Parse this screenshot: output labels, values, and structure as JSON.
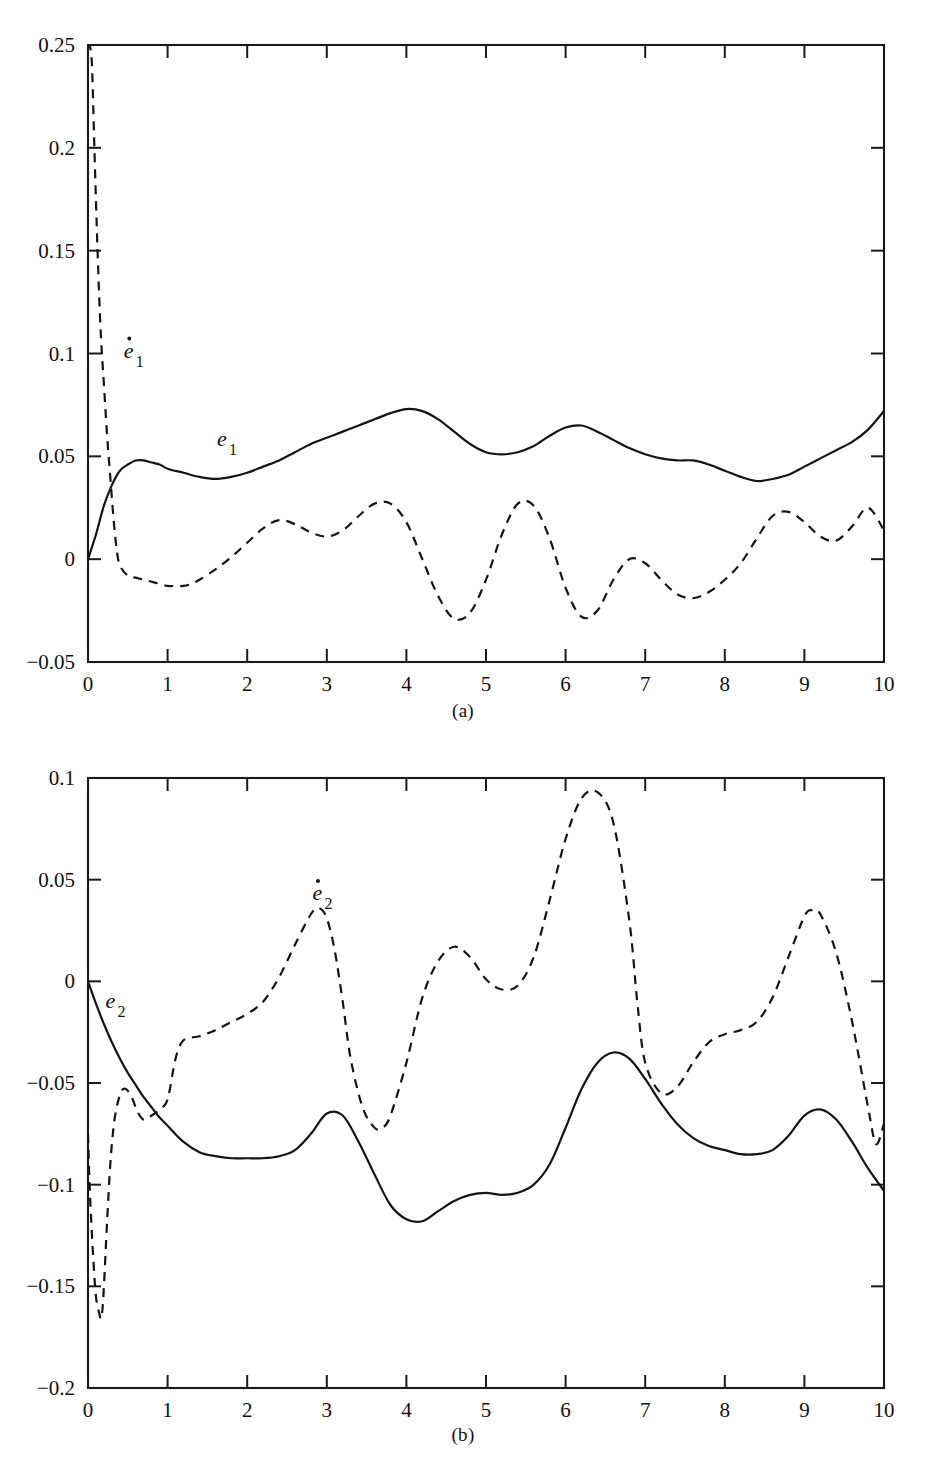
{
  "figure": {
    "panels": [
      {
        "id": "a",
        "caption": "(a)",
        "solid_label": "e",
        "solid_sub": "1",
        "dashed_label": "e",
        "dashed_sub": "1",
        "dashed_has_dot": true
      },
      {
        "id": "b",
        "caption": "(b)",
        "solid_label": "e",
        "solid_sub": "2",
        "dashed_label": "e",
        "dashed_sub": "2",
        "dashed_has_dot": true
      }
    ]
  },
  "chart_data": [
    {
      "type": "line",
      "panel": "a",
      "title": "",
      "xlabel": "",
      "ylabel": "",
      "xlim": [
        0,
        10
      ],
      "ylim": [
        -0.05,
        0.25
      ],
      "xticks": [
        0,
        1,
        2,
        3,
        4,
        5,
        6,
        7,
        8,
        9,
        10
      ],
      "xticklabels": [
        "0",
        "1",
        "2",
        "3",
        "4",
        "5",
        "6",
        "7",
        "8",
        "9",
        "10"
      ],
      "yticks": [
        -0.05,
        0,
        0.05,
        0.1,
        0.15,
        0.2,
        0.25
      ],
      "yticklabels": [
        "-0.05",
        "0",
        "0.05",
        "0.1",
        "0.15",
        "0.2",
        "0.25"
      ],
      "grid": false,
      "legend": "inline-annotation",
      "series": [
        {
          "name": "e_1",
          "style": "solid",
          "x": [
            0.0,
            0.1,
            0.2,
            0.3,
            0.4,
            0.5,
            0.6,
            0.7,
            0.8,
            0.9,
            1.0,
            1.2,
            1.4,
            1.6,
            1.8,
            2.0,
            2.2,
            2.4,
            2.6,
            2.8,
            3.0,
            3.2,
            3.4,
            3.6,
            3.8,
            4.0,
            4.2,
            4.4,
            4.6,
            4.8,
            5.0,
            5.2,
            5.4,
            5.6,
            5.8,
            6.0,
            6.2,
            6.4,
            6.6,
            6.8,
            7.0,
            7.2,
            7.4,
            7.6,
            7.8,
            8.0,
            8.2,
            8.4,
            8.6,
            8.8,
            9.0,
            9.2,
            9.4,
            9.6,
            9.8,
            10.0
          ],
          "y": [
            0.0,
            0.012,
            0.026,
            0.036,
            0.043,
            0.046,
            0.048,
            0.048,
            0.047,
            0.046,
            0.044,
            0.042,
            0.04,
            0.039,
            0.04,
            0.042,
            0.045,
            0.048,
            0.052,
            0.056,
            0.059,
            0.062,
            0.065,
            0.068,
            0.071,
            0.073,
            0.072,
            0.068,
            0.062,
            0.056,
            0.052,
            0.051,
            0.052,
            0.055,
            0.06,
            0.064,
            0.065,
            0.062,
            0.058,
            0.054,
            0.051,
            0.049,
            0.048,
            0.048,
            0.046,
            0.043,
            0.04,
            0.038,
            0.039,
            0.041,
            0.045,
            0.049,
            0.053,
            0.057,
            0.063,
            0.072
          ]
        },
        {
          "name": "e_1_dot",
          "style": "dashed",
          "x": [
            0.0,
            0.02,
            0.05,
            0.08,
            0.12,
            0.16,
            0.2,
            0.24,
            0.28,
            0.32,
            0.36,
            0.4,
            0.5,
            0.6,
            0.7,
            0.8,
            0.9,
            1.0,
            1.1,
            1.2,
            1.3,
            1.4,
            1.6,
            1.8,
            2.0,
            2.2,
            2.4,
            2.6,
            2.8,
            3.0,
            3.2,
            3.4,
            3.6,
            3.8,
            4.0,
            4.2,
            4.4,
            4.6,
            4.8,
            5.0,
            5.2,
            5.4,
            5.6,
            5.8,
            6.0,
            6.2,
            6.4,
            6.6,
            6.8,
            7.0,
            7.2,
            7.4,
            7.6,
            7.8,
            8.0,
            8.2,
            8.4,
            8.6,
            8.8,
            9.0,
            9.2,
            9.4,
            9.6,
            9.8,
            10.0
          ],
          "y": [
            0.25,
            0.25,
            0.24,
            0.2,
            0.15,
            0.11,
            0.085,
            0.06,
            0.04,
            0.02,
            0.005,
            -0.003,
            -0.008,
            -0.009,
            -0.01,
            -0.011,
            -0.012,
            -0.013,
            -0.013,
            -0.013,
            -0.012,
            -0.01,
            -0.005,
            0.001,
            0.008,
            0.015,
            0.019,
            0.017,
            0.013,
            0.011,
            0.014,
            0.021,
            0.027,
            0.027,
            0.018,
            0.0,
            -0.018,
            -0.029,
            -0.026,
            -0.01,
            0.012,
            0.027,
            0.026,
            0.01,
            -0.014,
            -0.028,
            -0.025,
            -0.01,
            0.0,
            -0.002,
            -0.01,
            -0.017,
            -0.019,
            -0.016,
            -0.01,
            -0.002,
            0.01,
            0.021,
            0.023,
            0.018,
            0.011,
            0.009,
            0.016,
            0.025,
            0.014
          ]
        }
      ],
      "annotations": [
        {
          "text": "e_1_dot",
          "x": 0.45,
          "y": 0.098
        },
        {
          "text": "e_1",
          "x": 1.62,
          "y": 0.055
        }
      ]
    },
    {
      "type": "line",
      "panel": "b",
      "title": "",
      "xlabel": "",
      "ylabel": "",
      "xlim": [
        0,
        10
      ],
      "ylim": [
        -0.2,
        0.1
      ],
      "xticks": [
        0,
        1,
        2,
        3,
        4,
        5,
        6,
        7,
        8,
        9,
        10
      ],
      "xticklabels": [
        "0",
        "1",
        "2",
        "3",
        "4",
        "5",
        "6",
        "7",
        "8",
        "9",
        "10"
      ],
      "yticks": [
        -0.2,
        -0.15,
        -0.1,
        -0.05,
        0,
        0.05,
        0.1
      ],
      "yticklabels": [
        "-0.2",
        "-0.15",
        "-0.1",
        "-0.05",
        "0",
        "0.05",
        "0.1"
      ],
      "grid": false,
      "legend": "inline-annotation",
      "series": [
        {
          "name": "e_2",
          "style": "solid",
          "x": [
            0.0,
            0.1,
            0.2,
            0.3,
            0.4,
            0.5,
            0.6,
            0.7,
            0.8,
            0.9,
            1.0,
            1.2,
            1.4,
            1.6,
            1.8,
            2.0,
            2.2,
            2.4,
            2.6,
            2.8,
            3.0,
            3.2,
            3.4,
            3.6,
            3.8,
            4.0,
            4.2,
            4.4,
            4.6,
            4.8,
            5.0,
            5.2,
            5.4,
            5.6,
            5.8,
            6.0,
            6.2,
            6.4,
            6.6,
            6.8,
            7.0,
            7.2,
            7.4,
            7.6,
            7.8,
            8.0,
            8.2,
            8.4,
            8.6,
            8.8,
            9.0,
            9.2,
            9.4,
            9.6,
            9.8,
            10.0
          ],
          "y": [
            0.0,
            -0.011,
            -0.021,
            -0.03,
            -0.038,
            -0.045,
            -0.051,
            -0.057,
            -0.062,
            -0.067,
            -0.071,
            -0.079,
            -0.084,
            -0.086,
            -0.087,
            -0.087,
            -0.087,
            -0.086,
            -0.083,
            -0.075,
            -0.065,
            -0.066,
            -0.079,
            -0.095,
            -0.11,
            -0.117,
            -0.118,
            -0.113,
            -0.108,
            -0.105,
            -0.104,
            -0.105,
            -0.104,
            -0.1,
            -0.09,
            -0.072,
            -0.053,
            -0.04,
            -0.035,
            -0.038,
            -0.048,
            -0.06,
            -0.07,
            -0.077,
            -0.081,
            -0.083,
            -0.085,
            -0.085,
            -0.083,
            -0.076,
            -0.066,
            -0.063,
            -0.068,
            -0.079,
            -0.092,
            -0.103
          ]
        },
        {
          "name": "e_2_dot",
          "style": "dashed",
          "x": [
            0.0,
            0.02,
            0.05,
            0.08,
            0.1,
            0.12,
            0.14,
            0.16,
            0.18,
            0.2,
            0.24,
            0.28,
            0.32,
            0.36,
            0.42,
            0.48,
            0.55,
            0.62,
            0.7,
            0.8,
            0.9,
            1.0,
            1.1,
            1.2,
            1.4,
            1.6,
            1.8,
            2.0,
            2.2,
            2.4,
            2.6,
            2.8,
            2.9,
            3.0,
            3.1,
            3.2,
            3.3,
            3.45,
            3.6,
            3.7,
            3.8,
            4.0,
            4.2,
            4.4,
            4.6,
            4.8,
            5.0,
            5.2,
            5.4,
            5.6,
            5.8,
            6.0,
            6.2,
            6.4,
            6.6,
            6.8,
            6.9,
            7.0,
            7.2,
            7.4,
            7.6,
            7.8,
            8.0,
            8.2,
            8.4,
            8.6,
            8.8,
            9.0,
            9.1,
            9.2,
            9.4,
            9.6,
            9.8,
            9.9,
            10.0
          ],
          "y": [
            -0.075,
            -0.1,
            -0.125,
            -0.145,
            -0.155,
            -0.16,
            -0.163,
            -0.166,
            -0.162,
            -0.15,
            -0.118,
            -0.09,
            -0.072,
            -0.062,
            -0.054,
            -0.053,
            -0.057,
            -0.064,
            -0.068,
            -0.066,
            -0.063,
            -0.058,
            -0.038,
            -0.029,
            -0.027,
            -0.024,
            -0.02,
            -0.016,
            -0.01,
            0.002,
            0.018,
            0.033,
            0.036,
            0.031,
            0.015,
            -0.01,
            -0.038,
            -0.062,
            -0.072,
            -0.072,
            -0.066,
            -0.04,
            -0.008,
            0.01,
            0.017,
            0.012,
            0.001,
            -0.004,
            -0.002,
            0.012,
            0.04,
            0.07,
            0.09,
            0.093,
            0.078,
            0.03,
            -0.01,
            -0.04,
            -0.055,
            -0.052,
            -0.04,
            -0.03,
            -0.026,
            -0.024,
            -0.02,
            -0.008,
            0.012,
            0.032,
            0.035,
            0.033,
            0.014,
            -0.02,
            -0.062,
            -0.08,
            -0.07
          ]
        }
      ],
      "annotations": [
        {
          "text": "e_2",
          "x": 0.22,
          "y": -0.013
        },
        {
          "text": "e_2_dot",
          "x": 2.82,
          "y": 0.04
        }
      ]
    }
  ]
}
